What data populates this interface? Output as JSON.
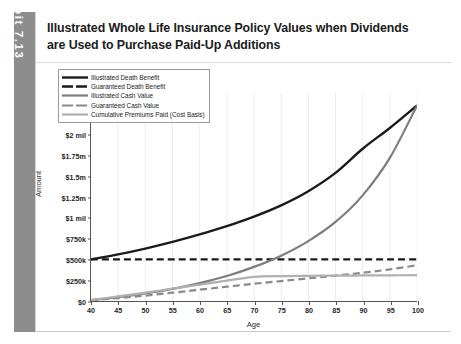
{
  "exhibit": {
    "label": "Exhibit 7.13",
    "tab_color": "#8d8d8d"
  },
  "title": {
    "line1": "Illustrated Whole Life Insurance Policy Values when Dividends",
    "line2": "are Used to Purchase Paid-Up Additions"
  },
  "chart_data": {
    "type": "line",
    "title": "Illustrated Whole Life Insurance Policy Values when Dividends are Used to Purchase Paid-Up Additions",
    "xlabel": "Age",
    "ylabel": "Amount",
    "xlim": [
      40,
      100
    ],
    "ylim": [
      0,
      2500000
    ],
    "xticks": [
      40,
      45,
      50,
      55,
      60,
      65,
      70,
      75,
      80,
      85,
      90,
      95,
      100
    ],
    "xticklabels": [
      "40",
      "45",
      "50",
      "55",
      "60",
      "65",
      "70",
      "75",
      "80",
      "85",
      "90",
      "95",
      "100"
    ],
    "yticks": [
      0,
      250000,
      500000,
      750000,
      1000000,
      1250000,
      1500000,
      1750000,
      2000000,
      2250000,
      2500000
    ],
    "yticklabels": [
      "$0",
      "$250k",
      "$500k",
      "$750k",
      "$1 mil",
      "$1.25m",
      "$1.5m",
      "$1.75m",
      "$2 mil",
      "$2.25m",
      "$2.5m"
    ],
    "grid": "vertical-faint",
    "legend_position": "upper-left",
    "x": [
      40,
      45,
      50,
      55,
      60,
      65,
      70,
      75,
      80,
      85,
      90,
      95,
      100
    ],
    "series": [
      {
        "name": "Illustrated Death Benefit",
        "color": "#1a1a1a",
        "style": "solid",
        "width": 2.4,
        "values": [
          500000,
          560000,
          630000,
          710000,
          800000,
          900000,
          1015000,
          1150000,
          1320000,
          1540000,
          1830000,
          2080000,
          2350000
        ]
      },
      {
        "name": "Guaranteed Death Benefit",
        "color": "#1a1a1a",
        "style": "dashed",
        "width": 2.4,
        "values": [
          500000,
          500000,
          500000,
          500000,
          500000,
          500000,
          500000,
          500000,
          500000,
          500000,
          500000,
          500000,
          500000
        ]
      },
      {
        "name": "Illustrated Cash Value",
        "color": "#7d7d7d",
        "style": "solid",
        "width": 2.2,
        "values": [
          10000,
          45000,
          90000,
          145000,
          215000,
          300000,
          410000,
          545000,
          720000,
          950000,
          1270000,
          1720000,
          2350000
        ]
      },
      {
        "name": "Guaranteed Cash Value",
        "color": "#8a8a8a",
        "style": "dashed",
        "width": 2.2,
        "values": [
          8000,
          35000,
          65000,
          100000,
          135000,
          172000,
          207000,
          240000,
          272000,
          305000,
          340000,
          380000,
          430000
        ]
      },
      {
        "name": "Cumulative Premiums Paid (Cost Basis)",
        "color": "#b0b0b0",
        "style": "solid",
        "width": 2.2,
        "values": [
          12000,
          55000,
          100000,
          148000,
          196000,
          245000,
          290000,
          300000,
          303000,
          305000,
          307000,
          309000,
          310000
        ]
      }
    ]
  }
}
